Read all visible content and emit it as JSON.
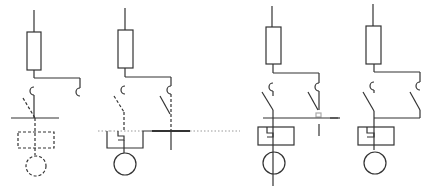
{
  "figure": {
    "title": "",
    "background": "#ffffff",
    "stroke_color": "#333333",
    "panels": [
      {
        "id": "panel-1",
        "x_center": 34,
        "state": "dashed switch, dashed coil and dashed motor (not yet drawn)"
      },
      {
        "id": "panel-2",
        "x_center": 126,
        "state": "dashed switches with dotted baseline, solid coil and motor"
      },
      {
        "id": "panel-3",
        "x_center": 272,
        "state": "solid switches, second branch open"
      },
      {
        "id": "panel-4",
        "x_center": 375,
        "state": "solid switches, both branches joined"
      }
    ],
    "components": [
      "fuse",
      "thermal-contact",
      "switch",
      "relay-coil",
      "motor"
    ]
  }
}
